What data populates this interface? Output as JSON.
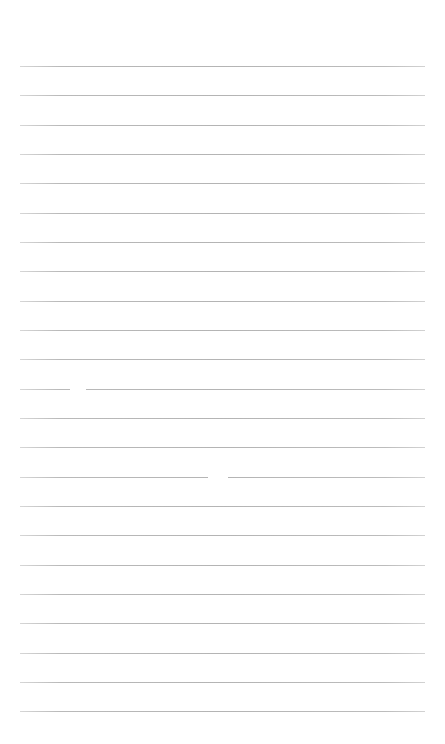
{
  "page": {
    "type": "lined-paper",
    "background_color": "#ffffff",
    "line_color": "#b4b4b4",
    "line_count": 23,
    "first_line_y": 66,
    "line_spacing": 29.33,
    "line_left": 20,
    "line_right": 425,
    "gaps": [
      {
        "line_index": 11,
        "x_start": 70,
        "x_end": 86
      },
      {
        "line_index": 14,
        "x_start": 208,
        "x_end": 228
      }
    ]
  }
}
